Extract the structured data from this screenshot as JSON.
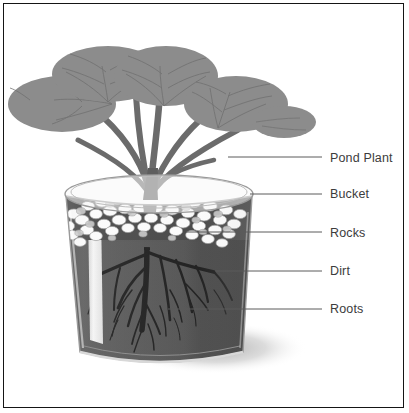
{
  "diagram": {
    "border_color": "#151515",
    "background": "#ffffff",
    "labels": [
      {
        "id": "pond-plant",
        "text": "Pond Plant",
        "text_x": 330,
        "text_y": 152,
        "leader_x1": 228,
        "leader_y1": 157,
        "leader_x2": 322,
        "leader_y2": 157
      },
      {
        "id": "bucket",
        "text": "Bucket",
        "text_x": 330,
        "text_y": 188,
        "leader_x1": 250,
        "leader_y1": 194,
        "leader_x2": 322,
        "leader_y2": 194
      },
      {
        "id": "rocks",
        "text": "Rocks",
        "text_x": 330,
        "text_y": 227,
        "leader_x1": 186,
        "leader_y1": 232,
        "leader_x2": 322,
        "leader_y2": 232
      },
      {
        "id": "dirt",
        "text": "Dirt",
        "text_x": 330,
        "text_y": 265,
        "leader_x1": 215,
        "leader_y1": 271,
        "leader_x2": 322,
        "leader_y2": 271
      },
      {
        "id": "roots",
        "text": "Roots",
        "text_x": 330,
        "text_y": 303,
        "leader_x1": 168,
        "leader_y1": 309,
        "leader_x2": 322,
        "leader_y2": 309
      }
    ],
    "colors": {
      "leaf": "#8c8c8c",
      "leaf_vein": "#6f6f6f",
      "stem": "#6b6b6b",
      "bucket_glass": "#f2f2f2",
      "bucket_outline": "#9a9a9a",
      "rocks_light": "#fbfbfb",
      "rocks_mid": "#cfcfcf",
      "rocks_shadow": "#8f8f8f",
      "dirt": "#4a4a4a",
      "dirt_dark": "#2e2e2e",
      "roots": "#0d0d0d",
      "tube": "#e8e8e8",
      "shadow": "#b8b8b8",
      "leader_line": "#5a5a5a"
    },
    "parts": {
      "plant_label": "Pond Plant",
      "bucket_label": "Bucket",
      "rocks_label": "Rocks",
      "dirt_label": "Dirt",
      "roots_label": "Roots",
      "tube_name": "watering-tube"
    }
  }
}
